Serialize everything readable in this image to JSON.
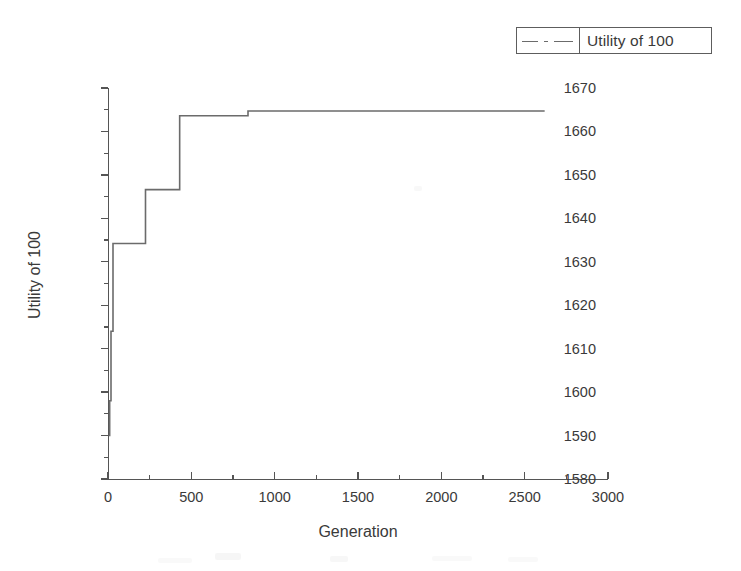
{
  "legend": {
    "entries": [
      {
        "label": "Utility of 100",
        "style": "dash-dot",
        "color": "#6b6b6b"
      }
    ],
    "position": "top-right"
  },
  "chart_data": {
    "type": "line",
    "title": "",
    "subtitle": "",
    "xlabel": "Generation",
    "ylabel": "Utility of 100",
    "xlim": [
      0,
      3000
    ],
    "ylim": [
      1580,
      1670
    ],
    "xticks": [
      0,
      500,
      1000,
      1500,
      2000,
      2500,
      3000
    ],
    "yticks": [
      1580,
      1590,
      1600,
      1610,
      1620,
      1630,
      1640,
      1650,
      1660,
      1670
    ],
    "x_minor_step": 250,
    "y_minor_step": 5,
    "grid": false,
    "legend_position": "top-right",
    "series": [
      {
        "name": "Utility of 100",
        "color": "#6b6b6b",
        "line_style": "dash-dot",
        "step": "post",
        "x": [
          5,
          10,
          18,
          30,
          225,
          430,
          840,
          2620
        ],
        "values": [
          1590.0,
          1598.0,
          1614.0,
          1634.2,
          1646.6,
          1663.6,
          1664.7,
          1664.7
        ]
      }
    ],
    "annotations": []
  },
  "axes": {
    "y_tick_labels": [
      "1670",
      "1660",
      "1650",
      "1640",
      "1630",
      "1620",
      "1610",
      "1600",
      "1590",
      "1580"
    ],
    "x_tick_labels": [
      "0",
      "500",
      "1000",
      "1500",
      "2000",
      "2500",
      "3000"
    ]
  }
}
